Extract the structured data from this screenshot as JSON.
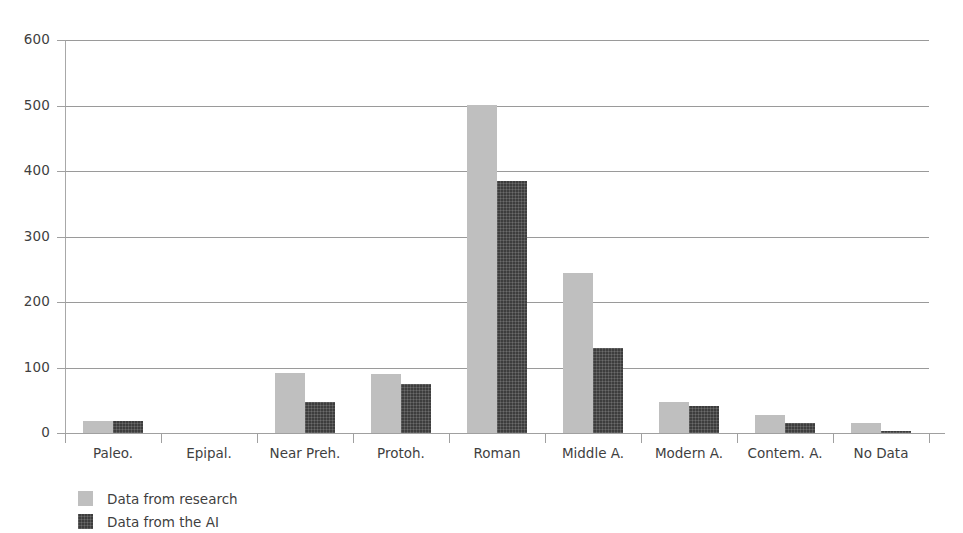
{
  "chart_data": {
    "type": "bar",
    "title": "",
    "subtitle": "",
    "xlabel": "",
    "ylabel": "",
    "ylim": [
      0,
      600
    ],
    "yticks": [
      0,
      100,
      200,
      300,
      400,
      500,
      600
    ],
    "ytick_labels": [
      "0",
      "100",
      "200",
      "300",
      "400",
      "500",
      "600"
    ],
    "grid": true,
    "legend_position": "bottom-left",
    "categories": [
      "Paleo.",
      "Epipal.",
      "Near Preh.",
      "Protoh.",
      "Roman",
      "Middle A.",
      "Modern A.",
      "Contem. A.",
      "No Data"
    ],
    "series": [
      {
        "name": "Data from research",
        "color": "#bfbfbf",
        "values": [
          19,
          0,
          92,
          90,
          501,
          245,
          47,
          27,
          16
        ]
      },
      {
        "name": "Data from the AI",
        "color": "#3d3d3d",
        "values": [
          19,
          0,
          48,
          75,
          384,
          130,
          42,
          15,
          3
        ]
      }
    ]
  },
  "legend": {
    "items": [
      {
        "label": "Data from research",
        "swatch": "light"
      },
      {
        "label": "Data from the AI",
        "swatch": "dark"
      }
    ]
  }
}
